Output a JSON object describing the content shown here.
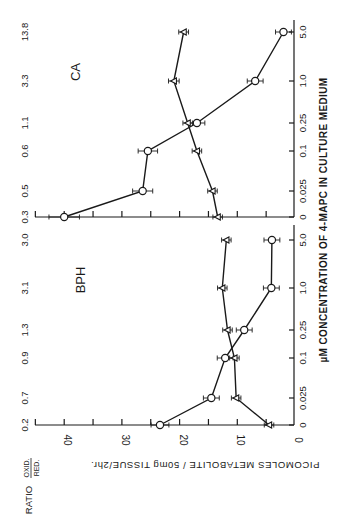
{
  "chart_data": [
    {
      "type": "line",
      "panel": "CA",
      "title": "CA",
      "orientation": "rotated-90",
      "categories": [
        "0",
        "0.025",
        "0.1",
        "0.25",
        "1.0",
        "5.0"
      ],
      "xlabel": "µM CONCENTRATION OF 4-MAPC IN CULTURE MEDIUM",
      "ylabel": "PICOMOLES METABOLITE / 50mg TISSUE/2hr.",
      "ylim": [
        0,
        43
      ],
      "yticks": [
        0,
        10,
        20,
        30,
        40
      ],
      "series": [
        {
          "name": "oxidized (circles)",
          "marker": "circle",
          "values": [
            40,
            26.4,
            25.5,
            17,
            6.9,
            2
          ]
        },
        {
          "name": "reduced (triangles)",
          "marker": "triangle",
          "values": [
            13.4,
            14.3,
            17,
            18.6,
            21,
            19.3
          ]
        }
      ],
      "ratio_label": "RATIO OXID./RED.",
      "ratios": [
        "0.3",
        "0.5",
        "0.6",
        "1.1",
        "3.3",
        "13.8"
      ]
    },
    {
      "type": "line",
      "panel": "BPH",
      "title": "BPH",
      "orientation": "rotated-90",
      "categories": [
        "0",
        "0.025",
        "0.1",
        "0.25",
        "1.0",
        "5.0"
      ],
      "xlabel": "µM CONCENTRATION OF 4-MAPC IN CULTURE MEDIUM",
      "ylabel": "PICOMOLES METABOLITE / 50mg TISSUE/2hr.",
      "ylim": [
        0,
        43
      ],
      "yticks": [
        0,
        10,
        20,
        30,
        40
      ],
      "series": [
        {
          "name": "oxidized (circles)",
          "marker": "circle",
          "values": [
            23.4,
            14.5,
            12.1,
            8.8,
            4.1,
            4
          ]
        },
        {
          "name": "reduced (triangles)",
          "marker": "triangle",
          "values": [
            4.5,
            10.2,
            10.5,
            11.7,
            12.6,
            11.9
          ]
        }
      ],
      "ratio_label": "RATIO OXID./RED.",
      "ratios": [
        "0.2",
        "0.7",
        "0.9",
        "1.3",
        "3.1",
        "3.0"
      ]
    }
  ],
  "labels": {
    "panel_ca": "CA",
    "panel_bph": "BPH",
    "value_axis": "PICOMOLES METABOLITE / 50mg TISSUE/2hr.",
    "conc_axis": "µM CONCENTRATION OF 4-MAPC IN CULTURE MEDIUM",
    "ratio_word": "RATIO",
    "ratio_num": "OXID.",
    "ratio_den": "RED.",
    "value_ticks": [
      "0",
      "10",
      "20",
      "30",
      "40"
    ],
    "conc_ticks": [
      "0",
      "0.025",
      "0.1",
      "0.25",
      "1.0",
      "5.0"
    ]
  },
  "colors": {
    "ink": "#1a1a1a",
    "background": "#ffffff"
  }
}
